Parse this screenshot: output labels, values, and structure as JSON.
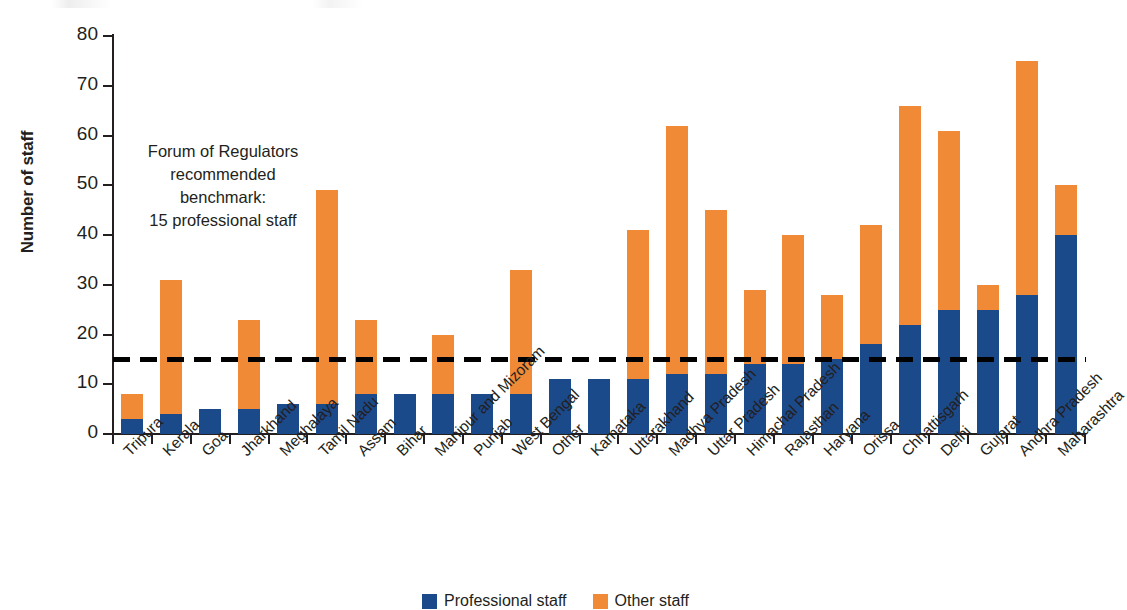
{
  "figure": {
    "y_axis_title": "Number of staff",
    "annotation_lines": [
      "Forum of Regulators",
      "recommended",
      "benchmark:",
      "15 professional staff"
    ],
    "benchmark_value": 15,
    "colors": {
      "professional_staff": "#1b4a8b",
      "other_staff": "#f08a37",
      "benchmark_line": "#000000",
      "axis": "#231f20"
    },
    "legend": [
      {
        "label": "Professional staff",
        "color": "#1b4a8b",
        "key": "professional-staff"
      },
      {
        "label": "Other staff",
        "color": "#f08a37",
        "key": "other-staff"
      }
    ]
  },
  "chart_data": {
    "type": "bar",
    "stacked": true,
    "title": "",
    "subtitle": "",
    "xlabel": "",
    "ylabel": "Number of staff",
    "ylim": [
      0,
      80
    ],
    "yticks": [
      0,
      10,
      20,
      30,
      40,
      50,
      60,
      70,
      80
    ],
    "ytick_labels": [
      "0",
      "10",
      "20",
      "30",
      "40",
      "50",
      "60",
      "70",
      "80"
    ],
    "grid": false,
    "legend_position": "bottom-center",
    "annotations": [
      {
        "text": "Forum of Regulators recommended benchmark: 15 professional staff",
        "type": "threshold-line",
        "value": 15,
        "style": "dashed"
      }
    ],
    "categories": [
      "Tripura",
      "Kerala",
      "Goa",
      "Jharkhand",
      "Meghalaya",
      "Tamil Nadu",
      "Assam",
      "Bihar",
      "Manipur and Mizoram",
      "Punjab",
      "West Bengal",
      "Other",
      "Karnataka",
      "Uttarakhand",
      "Madhya Pradesh",
      "Uttar Pradesh",
      "Himachal Pradesh",
      "Rajasthan",
      "Haryana",
      "Orissa",
      "Chhattisgarh",
      "Delhi",
      "Gujarat",
      "Andhra Pradesh",
      "Maharashtra"
    ],
    "series": [
      {
        "name": "Professional staff",
        "color": "#1b4a8b",
        "values": [
          3,
          4,
          5,
          5,
          6,
          6,
          8,
          8,
          8,
          8,
          8,
          11,
          11,
          11,
          12,
          12,
          14,
          14,
          15,
          18,
          22,
          25,
          25,
          28,
          40
        ]
      },
      {
        "name": "Other staff",
        "color": "#f08a37",
        "values": [
          5,
          27,
          0,
          18,
          0,
          43,
          15,
          0,
          12,
          0,
          25,
          0,
          0,
          30,
          50,
          33,
          15,
          26,
          13,
          24,
          44,
          36,
          5,
          47,
          10
        ]
      }
    ],
    "totals": [
      8,
      31,
      5,
      23,
      6,
      49,
      23,
      8,
      20,
      8,
      33,
      11,
      11,
      41,
      62,
      45,
      29,
      40,
      28,
      42,
      66,
      61,
      30,
      75,
      50
    ]
  }
}
